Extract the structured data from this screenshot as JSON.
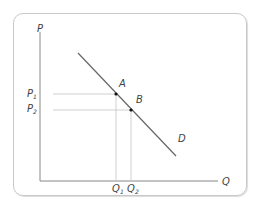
{
  "diagram": {
    "type": "demand-curve",
    "axes": {
      "y_label": "P",
      "x_label": "Q"
    },
    "curve": {
      "label": "D"
    },
    "points": [
      {
        "label": "A",
        "price_label": "P",
        "price_sub": "1",
        "quantity_label": "Q",
        "quantity_sub": "1"
      },
      {
        "label": "B",
        "price_label": "P",
        "price_sub": "2",
        "quantity_label": "Q",
        "quantity_sub": "2"
      }
    ],
    "colors": {
      "axis": "#888888",
      "curve": "#555555",
      "guide": "#bbbbbb",
      "point": "#111111",
      "text": "#444444",
      "frame": "#c8c8c8"
    }
  }
}
